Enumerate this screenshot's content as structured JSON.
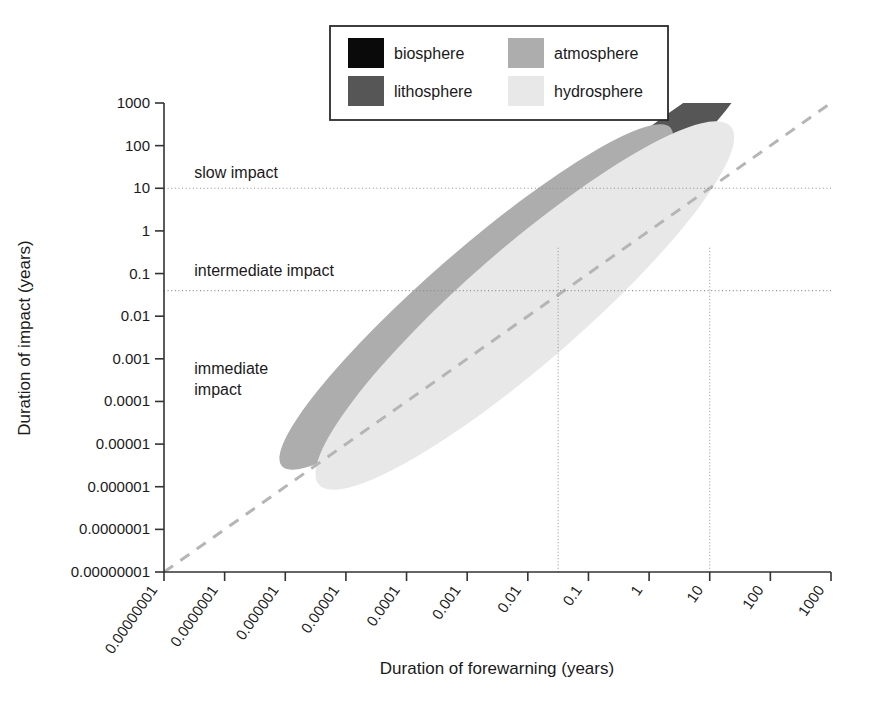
{
  "chart_data": {
    "type": "scatter",
    "title": "",
    "xlabel": "Duration of forewarning (years)",
    "ylabel": "Duration of impact (years)",
    "xtick_labels": [
      "0.00000001",
      "0.0000001",
      "0.000001",
      "0.00001",
      "0.0001",
      "0.001",
      "0.01",
      "0.1",
      "1",
      "10",
      "100",
      "1000"
    ],
    "ytick_labels": [
      "1000",
      "100",
      "10",
      "1",
      "0.1",
      "0.01",
      "0.001",
      "0.0001",
      "0.00001",
      "0.000001",
      "0.0000001",
      "0.00000001"
    ],
    "xlim_log10": [
      -8,
      3
    ],
    "ylim_log10": [
      -8,
      3
    ],
    "scale": "log-log",
    "grid": false,
    "legend_position": "top-center",
    "series": [
      {
        "name": "biosphere",
        "color": "#0a0a0a",
        "center_log10": [
          -2.25,
          -0.85
        ],
        "semi_major_decades": 2.55,
        "semi_minor_decades": 0.7,
        "angle_deg": -41
      },
      {
        "name": "lithosphere",
        "color": "#565656",
        "center_log10": [
          -1.15,
          0.3
        ],
        "semi_major_decades": 3.6,
        "semi_minor_decades": 0.62,
        "angle_deg": -41
      },
      {
        "name": "atmosphere",
        "color": "#adadad",
        "center_log10": [
          -2.85,
          -1.55
        ],
        "semi_major_decades": 4.25,
        "semi_minor_decades": 1.1,
        "angle_deg": -41
      },
      {
        "name": "hydrosphere",
        "color": "#e8e8e8",
        "center_log10": [
          -2.05,
          -1.75
        ],
        "semi_major_decades": 4.5,
        "semi_minor_decades": 1.35,
        "angle_deg": -41
      }
    ],
    "reference_line": {
      "name": "one-to-one-dashed",
      "from_log10": [
        -8,
        -8
      ],
      "to_log10": [
        3,
        3
      ],
      "style": "dashed",
      "color": "#b5b5b5"
    },
    "horizontal_markers": [
      {
        "name": "slow-impact-threshold",
        "y_value": 10,
        "y_log10": 1.0,
        "style": "dotted"
      },
      {
        "name": "intermediate-impact-threshold",
        "y_value": 0.04,
        "y_log10": -1.4,
        "style": "dotted"
      }
    ],
    "vertical_markers": [
      {
        "name": "forewarning-marker-left",
        "x_log10": -1.5,
        "style": "dotted"
      },
      {
        "name": "forewarning-marker-right",
        "x_log10": 1.0,
        "style": "dotted"
      }
    ],
    "annotations": [
      {
        "name": "slow-impact",
        "text": "slow impact",
        "x_log10": -7.5,
        "y_log10": 1.25
      },
      {
        "name": "intermediate-impact",
        "text": "intermediate impact",
        "x_log10": -7.5,
        "y_log10": -1.05
      },
      {
        "name": "immediate-impact-line1",
        "text": "immediate",
        "x_log10": -7.5,
        "y_log10": -3.35
      },
      {
        "name": "immediate-impact-line2",
        "text": "impact",
        "x_log10": -7.5,
        "y_log10": -3.85
      }
    ]
  },
  "legend": {
    "entries": [
      {
        "label": "biosphere",
        "color": "#0a0a0a"
      },
      {
        "label": "lithosphere",
        "color": "#565656"
      },
      {
        "label": "atmosphere",
        "color": "#adadad"
      },
      {
        "label": "hydrosphere",
        "color": "#e8e8e8"
      }
    ]
  },
  "axes": {
    "x_title": "Duration of forewarning (years)",
    "y_title": "Duration of impact (years)"
  }
}
